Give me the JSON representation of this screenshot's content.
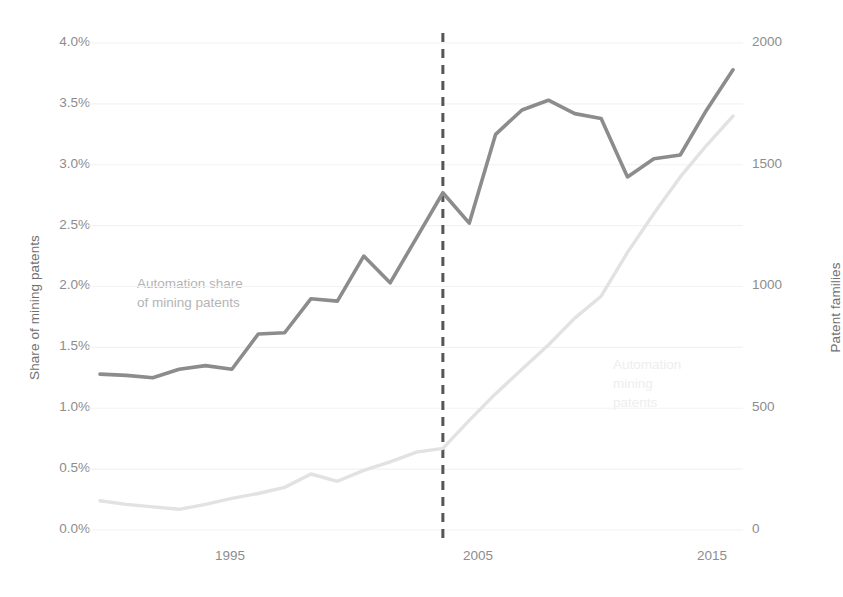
{
  "chart_data": {
    "type": "line",
    "title": "",
    "xlabel": "",
    "ylabel": "Share of mining patents",
    "ylabel_right": "Patent families",
    "grid": true,
    "legend_position": "inline-annotation",
    "xlim": [
      1992,
      2016
    ],
    "ylim": [
      0.0,
      4.0
    ],
    "ylim_right": [
      0,
      2000
    ],
    "x": [
      1992,
      1993,
      1994,
      1995,
      1996,
      1997,
      1998,
      1999,
      2000,
      2001,
      2002,
      2003,
      2004,
      2005,
      2006,
      2007,
      2008,
      2009,
      2010,
      2011,
      2012,
      2013,
      2014,
      2015,
      2016
    ],
    "xticks": [
      "1995",
      "2005",
      "2015"
    ],
    "xtick_values": [
      1995,
      2005,
      2015
    ],
    "yticks_left": [
      "0.0%",
      "0.5%",
      "1.0%",
      "1.5%",
      "2.0%",
      "2.5%",
      "3.0%",
      "3.5%",
      "4.0%"
    ],
    "ytick_values_left": [
      0.0,
      0.5,
      1.0,
      1.5,
      2.0,
      2.5,
      3.0,
      3.5,
      4.0
    ],
    "yticks_right": [
      "0",
      "500",
      "1000",
      "1500",
      "2000"
    ],
    "ytick_values_right": [
      0,
      500,
      1000,
      1500,
      2000
    ],
    "series": [
      {
        "name": "Automation share of mining patents",
        "axis": "left",
        "color": "#8c8c8c",
        "annotation": "Automation share\nof mining patents",
        "values": [
          1.28,
          1.27,
          1.25,
          1.32,
          1.35,
          1.32,
          1.61,
          1.62,
          1.9,
          1.88,
          2.25,
          2.03,
          2.4,
          2.77,
          2.52,
          3.25,
          3.45,
          3.53,
          3.42,
          3.38,
          2.9,
          3.05,
          3.08,
          3.45,
          3.78
        ]
      },
      {
        "name": "Automation mining patents",
        "axis": "right",
        "color": "#e2e2e2",
        "annotation": "Automation\nmining\npatents",
        "values": [
          120,
          105,
          95,
          85,
          105,
          130,
          150,
          175,
          230,
          200,
          245,
          280,
          320,
          335,
          450,
          560,
          660,
          760,
          870,
          960,
          1140,
          1300,
          1450,
          1580,
          1700
        ]
      }
    ],
    "annotations": [
      {
        "id": "vline-2005",
        "type": "vertical-dashed-line",
        "x": 2005,
        "color": "#555555",
        "label": ""
      }
    ]
  },
  "axes": {
    "left_title": "Share of mining patents",
    "right_title": "Patent families"
  }
}
